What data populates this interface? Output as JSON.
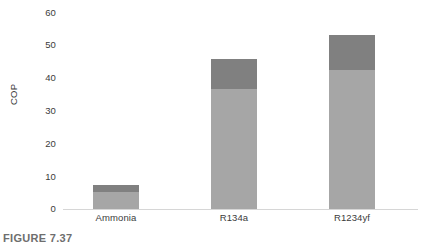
{
  "caption": "FIGURE 7.37",
  "axes": {
    "y_title": "COP",
    "y_ticks": [
      "60",
      "50",
      "40",
      "30",
      "20",
      "10",
      "0"
    ],
    "x_categories": [
      "Ammonia",
      "R134a",
      "R1234yf"
    ]
  },
  "colors": {
    "segment_top": "#808080",
    "segment_bottom": "#a6a6a6",
    "axis_line": "#d6d6d6",
    "text": "#3b3b3b",
    "caption": "#6e6e6e",
    "background": "#ffffff"
  },
  "chart_data": {
    "type": "bar",
    "stacked": true,
    "title": "",
    "subtitle": "",
    "xlabel": "",
    "ylabel": "COP",
    "ylim": [
      0,
      60
    ],
    "ytick_step": 10,
    "grid": false,
    "legend": null,
    "categories": [
      "Ammonia",
      "R134a",
      "R1234yf"
    ],
    "series": [
      {
        "name": "lower-segment",
        "color": "#a6a6a6",
        "values": [
          5,
          34.5,
          40
        ]
      },
      {
        "name": "upper-segment",
        "color": "#808080",
        "values": [
          2,
          8.5,
          10
        ]
      }
    ],
    "totals": [
      7,
      43,
      50
    ],
    "annotations": []
  }
}
